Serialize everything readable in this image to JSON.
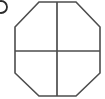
{
  "figure": {
    "background_color": "#ffffff",
    "line_color": "#4d4d4d",
    "label_color": "#2b2b2b",
    "canvas": {
      "width": 105,
      "height": 99
    },
    "label_marker": {
      "name": "figure-label-marker",
      "description": "partial circular glyph clipped at left edge",
      "text": ")",
      "center_x": 1,
      "center_y": 7,
      "radius": 6
    },
    "shape": {
      "type": "octagon",
      "name": "octagon-outline",
      "points": "39,2 76,2 100,27 100,73 76,96 39,96 15,73 15,27",
      "vertices": [
        {
          "x": 39,
          "y": 2
        },
        {
          "x": 76,
          "y": 2
        },
        {
          "x": 100,
          "y": 27
        },
        {
          "x": 100,
          "y": 73
        },
        {
          "x": 76,
          "y": 96
        },
        {
          "x": 39,
          "y": 96
        },
        {
          "x": 15,
          "y": 73
        },
        {
          "x": 15,
          "y": 27
        }
      ],
      "stroke_width": 1.6
    },
    "dividers": [
      {
        "name": "vertical-divider",
        "orientation": "vertical",
        "x1": 57,
        "y1": 2,
        "x2": 57,
        "y2": 96
      },
      {
        "name": "horizontal-divider",
        "orientation": "horizontal",
        "x1": 15,
        "y1": 51,
        "x2": 100,
        "y2": 51
      }
    ],
    "center": {
      "x": 57,
      "y": 51
    },
    "regions": 4
  }
}
